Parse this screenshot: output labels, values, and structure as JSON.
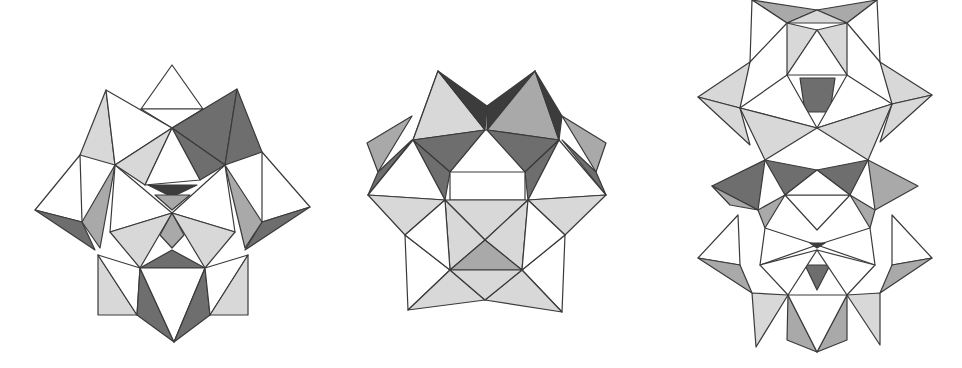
{
  "figures": [
    {
      "name": "polyhedral-cluster-left",
      "description": "Keggin-type polyoxometalate cluster viewed with threefold symmetry"
    },
    {
      "name": "polyhedral-cluster-center",
      "description": "Polyhedral cluster side view"
    },
    {
      "name": "polyhedral-cluster-right",
      "description": "Dimeric polyhedral cluster (Wells-Dawson-like)"
    }
  ],
  "colors": {
    "background": "#ffffff",
    "edge": "#3a3a3a",
    "white_face": "#ffffff",
    "light_face": "#d8d8d8",
    "mid_face": "#a9a9a9",
    "dark_face": "#6e6e6e",
    "darkest_face": "#3c3c3c"
  }
}
